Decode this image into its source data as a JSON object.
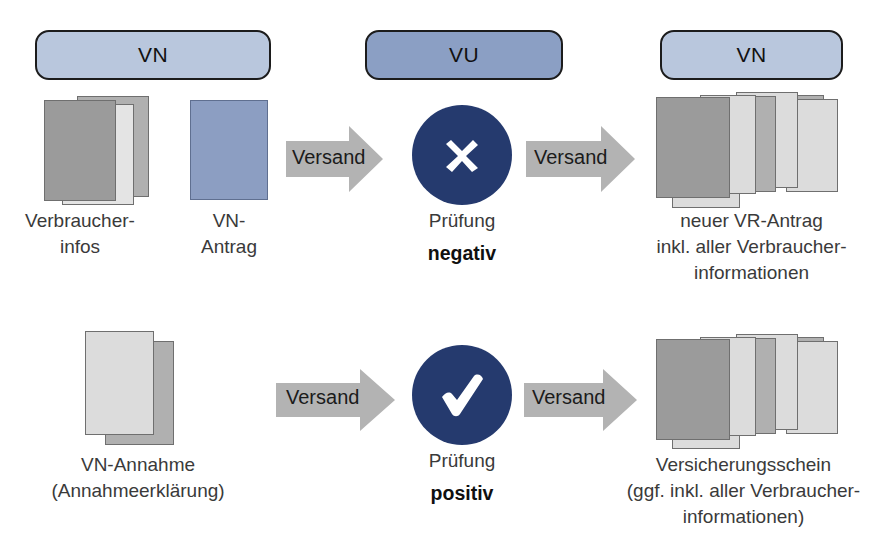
{
  "diagram": {
    "colors": {
      "pill_light": "#b9c7dd",
      "pill_dark": "#8b9fc4",
      "circle_navy": "#253a6e",
      "arrow_gray": "#b3b3b3",
      "sheet_dark": "#9b9b9b",
      "sheet_light": "#dcdcdc",
      "sheet_blue": "#8c9ec2",
      "outline": "#1c1c1c"
    },
    "lanes": [
      {
        "id": "lane-vn-left",
        "label": "VN",
        "style": "light"
      },
      {
        "id": "lane-vu",
        "label": "VU",
        "style": "dark"
      },
      {
        "id": "lane-vn-right",
        "label": "VN",
        "style": "light"
      }
    ],
    "rows": [
      {
        "id": "row-negative",
        "source": {
          "items": [
            {
              "id": "verbraucherinfos",
              "caption": "Verbraucher-\ninfos",
              "icon": "document-stack-icon"
            },
            {
              "id": "vn-antrag",
              "caption": "VN-\nAntrag",
              "icon": "document-icon"
            }
          ]
        },
        "arrow_in": {
          "label": "Versand",
          "icon": "arrow-right-icon"
        },
        "decision": {
          "id": "pruefung-negativ",
          "icon": "cross-icon",
          "caption": "Prüfung",
          "result": "negativ"
        },
        "arrow_out": {
          "label": "Versand",
          "icon": "arrow-right-icon"
        },
        "result": {
          "id": "neuer-vr-antrag",
          "icon": "document-fan-icon",
          "caption": "neuer VR-Antrag\ninkl. aller Verbraucher-\ninformationen"
        }
      },
      {
        "id": "row-positive",
        "source": {
          "items": [
            {
              "id": "vn-annahme",
              "caption": "VN-Annahme\n(Annahmeerklärung)",
              "icon": "document-stack-icon"
            }
          ]
        },
        "arrow_in": {
          "label": "Versand",
          "icon": "arrow-right-icon"
        },
        "decision": {
          "id": "pruefung-positiv",
          "icon": "check-icon",
          "caption": "Prüfung",
          "result": "positiv"
        },
        "arrow_out": {
          "label": "Versand",
          "icon": "arrow-right-icon"
        },
        "result": {
          "id": "versicherungsschein",
          "icon": "document-fan-icon",
          "caption": "Versicherungsschein\n(ggf. inkl. aller Verbraucher-\ninformationen)"
        }
      }
    ]
  }
}
